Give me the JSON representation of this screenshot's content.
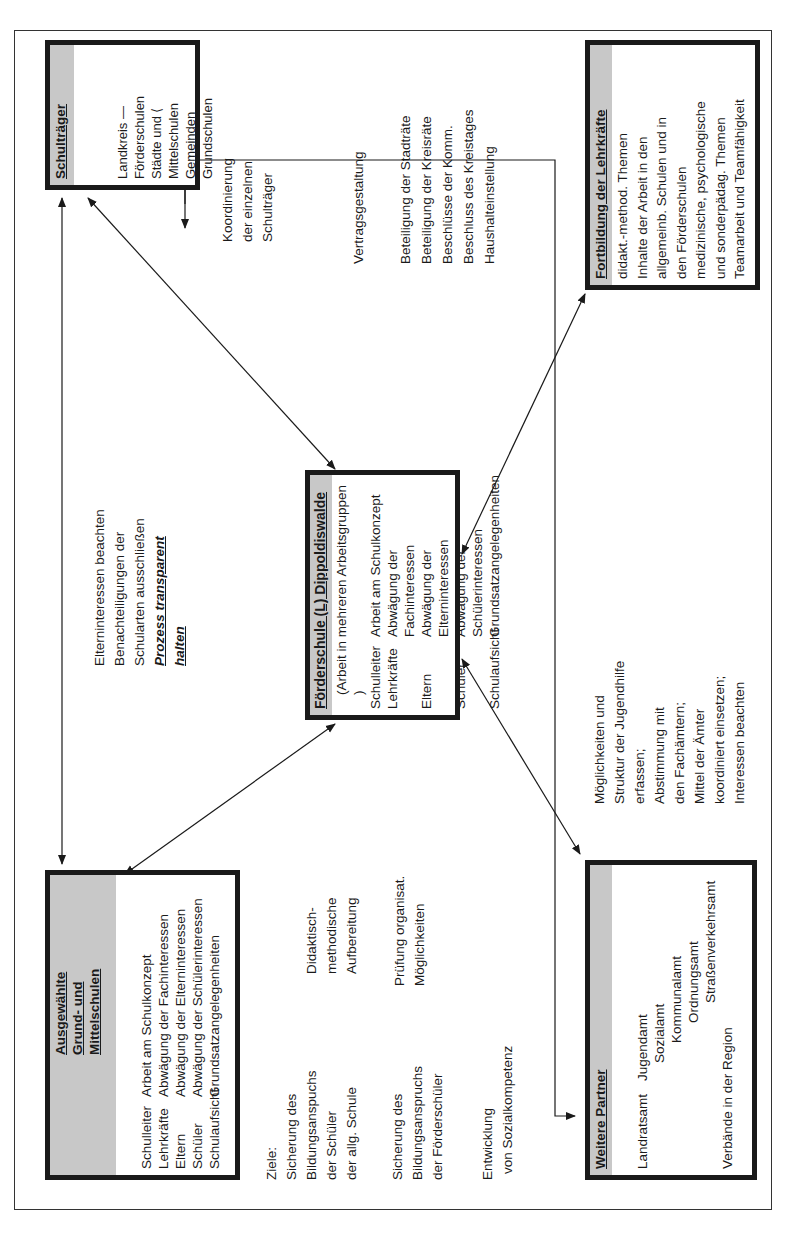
{
  "boxes": {
    "ausgewaehlte": {
      "title_lines": [
        "Ausgewählte",
        "Grund- und",
        "Mittelschulen"
      ],
      "rows": [
        {
          "role": "Schulleiter",
          "task": "Arbeit am Schulkonzept"
        },
        {
          "role": "Lehrkräfte",
          "task": "Abwägung der Fachinteressen"
        },
        {
          "role": "Eltern",
          "task": "Abwägung der Elterninteressen"
        },
        {
          "role": "Schüler",
          "task": "Abwägung der Schülerinteressen"
        },
        {
          "role": "Schulaufsicht",
          "task": "Grundsatzangelegenheiten"
        }
      ]
    },
    "schultraeger": {
      "title": "Schulträger",
      "lines": [
        "Landkreis — Förderschulen",
        "Städte und ⟨ Mittelschulen",
        "Gemeinden   Grundschulen"
      ]
    },
    "foerderschule": {
      "title": "Förderschule (L) Dippoldiswalde",
      "subtitle": "(Arbeit in mehreren Arbeitsgruppen )",
      "rows": [
        {
          "role": "Schulleiter",
          "task": "Arbeit am Schulkonzept"
        },
        {
          "role": "Lehrkräfte",
          "task": "Abwägung der Fachinteressen"
        },
        {
          "role": "Eltern",
          "task": "Abwägung der Elterninteressen"
        },
        {
          "role": "Schüler",
          "task": "Abwägung der Schülerinteressen"
        },
        {
          "role": "Schulaufsicht",
          "task": "Grundsatzangelegenheiten"
        }
      ]
    },
    "weitere_partner": {
      "title": "Weitere Partner",
      "group_label": "Landratsamt",
      "offices": [
        "Jugendamt",
        "Sozialamt",
        "Kommunalamt",
        "Ordnungsamt",
        "Straßenverkehrsamt"
      ],
      "footer": "Verbände in der Region"
    },
    "fortbildung": {
      "title": "Fortbildung der Lehrkräfte",
      "lines": [
        "didakt.-method. Themen",
        "Inhalte der Arbeit in den",
        "allgemeinb. Schulen und in",
        "den Förderschulen",
        "medizinische, psychologische",
        "und sonderpädag. Themen",
        "Teamarbeit und Teamfähigkeit"
      ]
    }
  },
  "annotations": {
    "ziele": [
      "Ziele:",
      "Sicherung des",
      "Bildungsanspuchs",
      "der Schüler",
      "der allg. Schule"
    ],
    "ziele2": [
      "Sicherung des",
      "Bildungsanspruchs",
      "der Förderschüler"
    ],
    "sozial": [
      "Entwicklung",
      "von Sozialkompetenz"
    ],
    "didaktisch": [
      "Didaktisch-",
      "methodische",
      "Aufbereitung"
    ],
    "pruefung": [
      "Prüfung organisat.",
      "Möglichkeiten"
    ],
    "eltern": [
      "Elterninteressen beachten",
      "Benachteiligungen der",
      "Schularten ausschließen"
    ],
    "prozess": [
      "Prozess transparent",
      "halten"
    ],
    "koordinierung": [
      "Koordinierung",
      "der einzelnen",
      "Schulträger"
    ],
    "vertrag": [
      "Vertragsgestaltung"
    ],
    "beteiligung": [
      "Beteiligung der Stadträte",
      "Beteiligung der Kreisräte",
      "Beschlüsse der Komm.",
      "Beschluss des Kreistages",
      "Haushalteinstellung"
    ],
    "jugendhilfe": [
      "Möglichkeiten und",
      "Struktur der Jugendhilfe",
      "erfassen;",
      "Abstimmung mit",
      "den Fachämtern;",
      "Mittel der Ämter",
      "koordiniert einsetzen;",
      "Interessen beachten"
    ]
  }
}
